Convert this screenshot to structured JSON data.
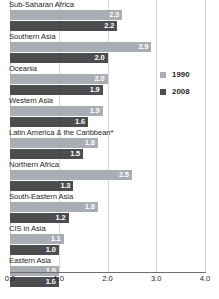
{
  "chart_data": {
    "type": "bar",
    "orientation": "horizontal",
    "title": "",
    "xlabel": "",
    "ylabel": "",
    "xlim": [
      0.0,
      4.0
    ],
    "grid": true,
    "gridlines": [
      0.0,
      1.0,
      2.0,
      3.0,
      4.0
    ],
    "legend_position": "right",
    "categories": [
      "Sub-Saharan Africa",
      "Southern Asia",
      "Oceania",
      "Western Asia",
      "Latin America & the Caribbean*",
      "Northern Africa",
      "South-Eastern Asia",
      "CIS in Asia",
      "Eastern Asia"
    ],
    "series": [
      {
        "name": "1990",
        "color": "#a8aeb4",
        "values": [
          2.3,
          2.9,
          2.0,
          1.9,
          1.8,
          2.5,
          1.8,
          1.1,
          1.0
        ],
        "labels": [
          "2.3",
          "2.9",
          "2.0",
          "1.9",
          "1.8",
          "2.5",
          "1.8",
          "1.1",
          "1.0"
        ]
      },
      {
        "name": "2008",
        "color": "#4d4d4f",
        "values": [
          2.2,
          2.0,
          1.9,
          1.6,
          1.5,
          1.3,
          1.2,
          1.0,
          1.0
        ],
        "labels": [
          "2.2",
          "2.0",
          "1.9",
          "1.6",
          "1.5",
          "1.3",
          "1.2",
          "1.0",
          "1.0"
        ]
      }
    ],
    "xticks": [
      "0.0",
      "1.0",
      "2.0",
      "3.0",
      "4.0"
    ],
    "xtick_values": [
      0.0,
      1.0,
      2.0,
      3.0,
      4.0
    ]
  },
  "legend": {
    "items": [
      {
        "label": "1990",
        "color": "#a8aeb4"
      },
      {
        "label": "2008",
        "color": "#4d4d4f"
      }
    ]
  },
  "footnote": {
    "text": ""
  },
  "colors": {
    "series_1990": "#a8aeb4",
    "series_2008": "#4d4d4f",
    "gridline": "#d8d8d8",
    "axis": "#6d6e71",
    "text": "#231f20",
    "background": "#ffffff"
  }
}
